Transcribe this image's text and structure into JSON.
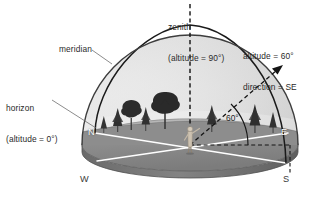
{
  "figure": {
    "domain": "diagram",
    "background_color": "#ffffff",
    "width": 323,
    "height": 200
  },
  "labels": {
    "zenith": "zenith\n(altitude = 90°)",
    "zenith_line1": "zenith",
    "zenith_line2": "(altitude = 90°)",
    "meridian": "meridian",
    "horizon": "horizon\n(altitude = 0°)",
    "horizon_line1": "horizon",
    "horizon_line2": "(altitude = 0°)",
    "altitude_direction": "altitude = 60°\ndirection = SE",
    "altitude_value": "altitude = 60°",
    "direction_value": "direction = SE",
    "angle_arc": "60°"
  },
  "cardinal_points": {
    "north": "N",
    "east": "E",
    "west": "W",
    "south": "S"
  },
  "caption": {
    "text": ""
  },
  "colors": {
    "background": "#ffffff",
    "dome_light": "#f2f2f2",
    "dome_mid": "#d9d9d9",
    "dome_shadow": "#b9b9b9",
    "ground_top": "#8f8f8f",
    "ground_side": "#6e6e6e",
    "ground_front": "#9a9a9a",
    "outline": "#4a4a4a",
    "meridian_stroke": "#1a1a1a",
    "axis_line": "#ffffff",
    "dashed_line": "#111111",
    "tree_fill": "#2e2e2e",
    "text": "#2a2a2a",
    "leader": "#6a6a6a",
    "observer": "#cfc4b4"
  },
  "geometry": {
    "dome_center_x": 190,
    "dome_center_y": 145,
    "dome_radius_x": 108,
    "dome_radius_y": 110,
    "base_ellipse_ry": 26,
    "zenith_x": 190,
    "zenith_top_y": 22,
    "observer_x": 190,
    "observer_y": 145,
    "arrow_tip_x": 281,
    "arrow_tip_y": 66,
    "altitude_degrees": 60,
    "direction": "SE"
  }
}
